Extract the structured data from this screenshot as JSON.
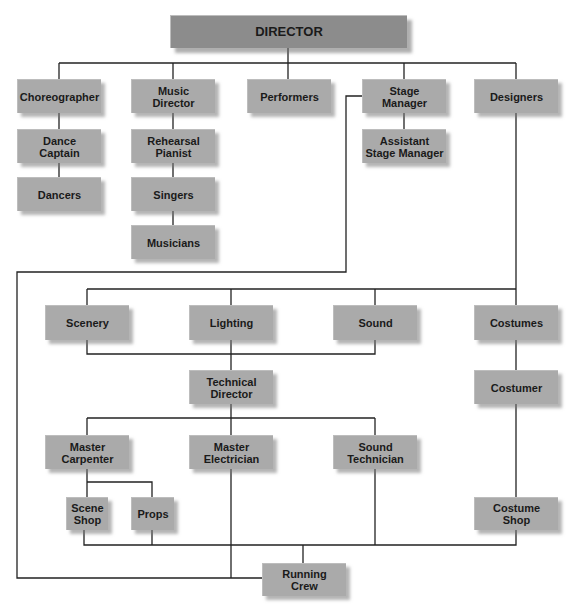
{
  "diagram": {
    "type": "org-chart",
    "colors": {
      "box": "#aaaaaa",
      "director_box": "#8c8c8c",
      "line": "#222222",
      "text": "#1a1a1a"
    },
    "nodes": {
      "director": "DIRECTOR",
      "choreographer": "Choreographer",
      "music_director": "Music\nDirector",
      "performers": "Performers",
      "stage_manager": "Stage\nManager",
      "designers": "Designers",
      "dance_captain": "Dance\nCaptain",
      "dancers": "Dancers",
      "rehearsal_pianist": "Rehearsal\nPianist",
      "singers": "Singers",
      "musicians": "Musicians",
      "assistant_stage_manager": "Assistant\nStage Manager",
      "scenery": "Scenery",
      "lighting": "Lighting",
      "sound": "Sound",
      "costumes": "Costumes",
      "technical_director": "Technical\nDirector",
      "costumer": "Costumer",
      "master_carpenter": "Master\nCarpenter",
      "master_electrician": "Master\nElectrician",
      "sound_technician": "Sound\nTechnician",
      "scene_shop": "Scene\nShop",
      "props": "Props",
      "costume_shop": "Costume\nShop",
      "running_crew": "Running\nCrew"
    },
    "edges": [
      [
        "DIRECTOR",
        "Choreographer"
      ],
      [
        "DIRECTOR",
        "Music Director"
      ],
      [
        "DIRECTOR",
        "Performers"
      ],
      [
        "DIRECTOR",
        "Stage Manager"
      ],
      [
        "DIRECTOR",
        "Designers"
      ],
      [
        "Choreographer",
        "Dance Captain"
      ],
      [
        "Dance Captain",
        "Dancers"
      ],
      [
        "Music Director",
        "Rehearsal Pianist"
      ],
      [
        "Rehearsal Pianist",
        "Singers"
      ],
      [
        "Singers",
        "Musicians"
      ],
      [
        "Stage Manager",
        "Assistant Stage Manager"
      ],
      [
        "Stage Manager",
        "Running Crew"
      ],
      [
        "Designers",
        "Scenery"
      ],
      [
        "Designers",
        "Lighting"
      ],
      [
        "Designers",
        "Sound"
      ],
      [
        "Designers",
        "Costumes"
      ],
      [
        "Scenery",
        "Technical Director"
      ],
      [
        "Lighting",
        "Technical Director"
      ],
      [
        "Sound",
        "Technical Director"
      ],
      [
        "Technical Director",
        "Master Carpenter"
      ],
      [
        "Technical Director",
        "Master Electrician"
      ],
      [
        "Technical Director",
        "Sound Technician"
      ],
      [
        "Master Carpenter",
        "Scene Shop"
      ],
      [
        "Master Carpenter",
        "Props"
      ],
      [
        "Costumes",
        "Costumer"
      ],
      [
        "Costumer",
        "Costume Shop"
      ],
      [
        "Scene Shop",
        "Running Crew"
      ],
      [
        "Props",
        "Running Crew"
      ],
      [
        "Sound Technician",
        "Running Crew"
      ],
      [
        "Costume Shop",
        "Running Crew"
      ],
      [
        "Master Electrician",
        "Running Crew"
      ]
    ]
  }
}
